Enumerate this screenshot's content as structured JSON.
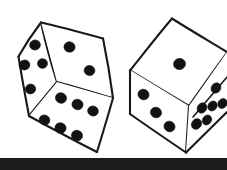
{
  "image": {
    "title": "Two rolled dice line drawing",
    "subject": "dice",
    "style": "black ink line drawing on white background",
    "width": 227,
    "height": 170,
    "background_color": "#ffffff",
    "ink_color": "#1a1a1a",
    "pip_color": "#121212"
  },
  "scene": {
    "object_count": 2,
    "objects": [
      {
        "name": "left-die",
        "label": "Left die",
        "position": "left",
        "visible_faces": 3,
        "total_visible_pips": 12,
        "faces": [
          {
            "name": "left-face",
            "label": "Left side face",
            "pip_count": 4,
            "pip_layout": "four-scatter",
            "polygon": "18,56 41,22 57,82 29,116",
            "pips": [
              {
                "cx": 35.0,
                "cy": 45.0,
                "rx": 5.4,
                "ry": 5.0
              },
              {
                "cx": 24.5,
                "cy": 65.0,
                "rx": 5.4,
                "ry": 5.0
              },
              {
                "cx": 42.5,
                "cy": 63.5,
                "rx": 5.0,
                "ry": 4.8
              },
              {
                "cx": 30.5,
                "cy": 89.0,
                "rx": 5.2,
                "ry": 4.9
              }
            ]
          },
          {
            "name": "top-right-face",
            "label": "Upper right face",
            "pip_count": 2,
            "pip_layout": "diagonal-two",
            "polygon": "41,22 103,38 113,98 57,82",
            "pips": [
              {
                "cx": 69.5,
                "cy": 47.0,
                "rx": 5.6,
                "ry": 5.2
              },
              {
                "cx": 89.5,
                "cy": 70.5,
                "rx": 5.4,
                "ry": 5.0
              }
            ]
          },
          {
            "name": "front-bottom-face",
            "label": "Front lower face",
            "pip_count": 6,
            "pip_layout": "six-two-rows-of-three",
            "polygon": "57,82 113,98 97,152 29,116",
            "pips": [
              {
                "cx": 61.0,
                "cy": 98.0,
                "rx": 5.6,
                "ry": 5.2
              },
              {
                "cx": 77.5,
                "cy": 104.5,
                "rx": 5.6,
                "ry": 5.2
              },
              {
                "cx": 93.0,
                "cy": 111.0,
                "rx": 5.4,
                "ry": 5.0
              },
              {
                "cx": 44.5,
                "cy": 120.0,
                "rx": 5.4,
                "ry": 5.0
              },
              {
                "cx": 60.5,
                "cy": 128.0,
                "rx": 5.6,
                "ry": 5.2
              },
              {
                "cx": 77.0,
                "cy": 135.5,
                "rx": 5.6,
                "ry": 5.2
              }
            ]
          }
        ]
      },
      {
        "name": "right-die",
        "label": "Right die",
        "position": "right",
        "visible_faces": 3,
        "total_visible_pips": 10,
        "partially_cropped": true,
        "faces": [
          {
            "name": "top-face",
            "label": "Top face",
            "pip_count": 1,
            "pip_layout": "center-one",
            "polygon": "130,70 172,18 227,52 189,106",
            "pips": [
              {
                "cx": 179.5,
                "cy": 64.0,
                "rx": 6.0,
                "ry": 5.6
              }
            ]
          },
          {
            "name": "left-face",
            "label": "Left front face",
            "pip_count": 3,
            "pip_layout": "diagonal-three",
            "polygon": "130,70 189,106 186,152 130,114",
            "pips": [
              {
                "cx": 143.5,
                "cy": 94.5,
                "rx": 5.6,
                "ry": 5.2
              },
              {
                "cx": 156.0,
                "cy": 112.5,
                "rx": 5.6,
                "ry": 5.2
              },
              {
                "cx": 169.5,
                "cy": 126.5,
                "rx": 5.6,
                "ry": 5.2
              }
            ]
          },
          {
            "name": "right-face",
            "label": "Right face (cropped by frame edge)",
            "pip_count": 6,
            "pip_layout": "six-two-diagonal-rows",
            "polygon": "189,106 227,52 227,108 186,152",
            "pips": [
              {
                "cx": 216.0,
                "cy": 88.0,
                "rx": 4.6,
                "ry": 5.4
              },
              {
                "cx": 222.5,
                "cy": 103.5,
                "rx": 4.4,
                "ry": 5.2
              },
              {
                "cx": 202.0,
                "cy": 108.0,
                "rx": 4.6,
                "ry": 5.4
              },
              {
                "cx": 212.5,
                "cy": 106.0,
                "rx": 4.4,
                "ry": 5.2
              },
              {
                "cx": 196.5,
                "cy": 124.0,
                "rx": 4.8,
                "ry": 5.6
              },
              {
                "cx": 207.0,
                "cy": 120.0,
                "rx": 4.4,
                "ry": 5.2
              }
            ]
          }
        ]
      }
    ]
  },
  "bottom_bar": {
    "name": "bottom-black-bar",
    "label": "Black horizontal bar at the bottom edge",
    "color": "#1b1b1b",
    "top": 158,
    "height": 12
  }
}
